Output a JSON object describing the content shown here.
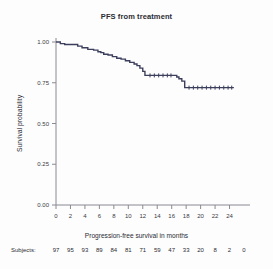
{
  "figure": {
    "title": "PFS from treatment",
    "background_color": "#fdfdfd",
    "curve_color": "#3b3f5c",
    "axis_color": "#8a8a92",
    "text_color": "#2b2b33"
  },
  "axes": {
    "x_title": "Progression-free survival in months",
    "y_title": "Survival probability",
    "x_ticks": [
      "0",
      "2",
      "4",
      "6",
      "8",
      "10",
      "12",
      "14",
      "16",
      "18",
      "20",
      "22",
      "24"
    ],
    "y_ticks": [
      "0.00",
      "0.25",
      "0.50",
      "0.75",
      "1.00"
    ]
  },
  "risk_table": {
    "label": "Subjects:",
    "times": [
      0,
      2,
      4,
      6,
      8,
      10,
      12,
      14,
      16,
      18,
      20,
      22,
      24,
      26
    ],
    "counts": [
      "97",
      "95",
      "93",
      "89",
      "84",
      "81",
      "71",
      "59",
      "47",
      "33",
      "20",
      "8",
      "2",
      "0"
    ]
  },
  "chart_data": {
    "type": "line",
    "title": "PFS from treatment",
    "xlabel": "Progression-free survival in months",
    "ylabel": "Survival probability",
    "xlim": [
      0,
      26
    ],
    "ylim": [
      0,
      1
    ],
    "xticks": [
      0,
      2,
      4,
      6,
      8,
      10,
      12,
      14,
      16,
      18,
      20,
      22,
      24
    ],
    "yticks": [
      0,
      0.25,
      0.5,
      0.75,
      1
    ],
    "grid": false,
    "legend": "none",
    "step_style": "post",
    "series": [
      {
        "name": "PFS",
        "x": [
          0.0,
          0.6,
          1.2,
          3.0,
          3.6,
          4.4,
          5.2,
          5.8,
          6.2,
          6.6,
          7.2,
          7.8,
          8.4,
          9.0,
          9.6,
          10.2,
          10.8,
          11.2,
          11.6,
          12.0,
          12.3,
          16.3,
          16.7,
          17.0,
          17.4,
          17.8,
          24.6
        ],
        "y": [
          1.0,
          0.99,
          0.985,
          0.975,
          0.965,
          0.955,
          0.95,
          0.94,
          0.935,
          0.925,
          0.92,
          0.91,
          0.9,
          0.895,
          0.885,
          0.875,
          0.865,
          0.855,
          0.84,
          0.82,
          0.795,
          0.795,
          0.785,
          0.775,
          0.76,
          0.72,
          0.72
        ]
      }
    ],
    "censor_marks": {
      "x": [
        13.0,
        13.6,
        14.2,
        14.8,
        15.4,
        15.9,
        18.4,
        19.0,
        19.6,
        20.2,
        20.8,
        21.4,
        22.0,
        22.6,
        23.2,
        23.8,
        24.3
      ],
      "y": [
        0.795,
        0.795,
        0.795,
        0.795,
        0.795,
        0.795,
        0.72,
        0.72,
        0.72,
        0.72,
        0.72,
        0.72,
        0.72,
        0.72,
        0.72,
        0.72,
        0.72
      ]
    },
    "risk_table": {
      "label": "Subjects:",
      "times": [
        0,
        2,
        4,
        6,
        8,
        10,
        12,
        14,
        16,
        18,
        20,
        22,
        24,
        26
      ],
      "counts": [
        97,
        95,
        93,
        89,
        84,
        81,
        71,
        59,
        47,
        33,
        20,
        8,
        2,
        0
      ]
    }
  }
}
